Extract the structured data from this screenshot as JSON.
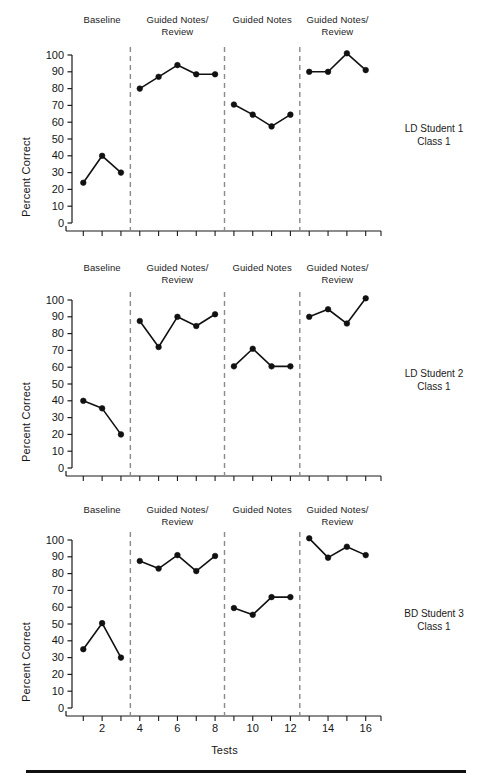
{
  "figure": {
    "xlabel": "Tests",
    "ylabel": "Percent Correct",
    "y_ticks": [
      "0",
      "10",
      "20",
      "30",
      "40",
      "50",
      "60",
      "70",
      "80",
      "90",
      "100"
    ],
    "x_ticks": [
      "2",
      "4",
      "6",
      "8",
      "10",
      "12",
      "14",
      "16"
    ],
    "phase_labels": [
      "Baseline",
      "Guided Notes/\nReview",
      "Guided Notes",
      "Guided Notes/\nReview"
    ],
    "line_color": "#111111",
    "marker_color": "#111111",
    "axis_color": "#1a1a1a",
    "phase_line_color": "#8a8a8a",
    "rule_color": "#111111"
  },
  "chart_data": {
    "type": "line",
    "title": "",
    "xlabel": "Tests",
    "ylabel": "Percent Correct",
    "xlim": [
      0.4,
      16.6
    ],
    "ylim": [
      0,
      100
    ],
    "x_ticks": [
      2,
      4,
      6,
      8,
      10,
      12,
      14,
      16
    ],
    "y_ticks": [
      0,
      10,
      20,
      30,
      40,
      50,
      60,
      70,
      80,
      90,
      100
    ],
    "grid": false,
    "legend": "none",
    "phase_boundaries": [
      3.5,
      8.5,
      12.5
    ],
    "phases": [
      {
        "label": "Baseline",
        "x_range": [
          1,
          3
        ]
      },
      {
        "label": "Guided Notes/\nReview",
        "x_range": [
          4,
          8
        ]
      },
      {
        "label": "Guided Notes",
        "x_range": [
          9,
          12
        ]
      },
      {
        "label": "Guided Notes/\nReview",
        "x_range": [
          13,
          16
        ]
      }
    ],
    "panels": [
      {
        "name": "LD Student 1\nClass 1",
        "series": [
          {
            "name": "Baseline",
            "x": [
              1,
              2,
              3
            ],
            "y": [
              24,
              40,
              30
            ]
          },
          {
            "name": "Guided Notes/Review",
            "x": [
              4,
              5,
              6,
              7,
              8
            ],
            "y": [
              80,
              87,
              94,
              88.5,
              88.5
            ]
          },
          {
            "name": "Guided Notes",
            "x": [
              9,
              10,
              11,
              12
            ],
            "y": [
              70.5,
              64.5,
              57.5,
              64.5
            ]
          },
          {
            "name": "Guided Notes/Review",
            "x": [
              13,
              14,
              15,
              16
            ],
            "y": [
              90,
              90,
              101,
              91
            ]
          }
        ]
      },
      {
        "name": "LD Student 2\nClass 1",
        "series": [
          {
            "name": "Baseline",
            "x": [
              1,
              2,
              3
            ],
            "y": [
              40,
              35.5,
              20
            ]
          },
          {
            "name": "Guided Notes/Review",
            "x": [
              4,
              5,
              6,
              7,
              8
            ],
            "y": [
              87.5,
              72,
              90,
              84.5,
              91.5
            ]
          },
          {
            "name": "Guided Notes",
            "x": [
              9,
              10,
              11,
              12
            ],
            "y": [
              60.5,
              71,
              60.5,
              60.5
            ]
          },
          {
            "name": "Guided Notes/Review",
            "x": [
              13,
              14,
              15,
              16
            ],
            "y": [
              90,
              94.5,
              86,
              101
            ]
          }
        ]
      },
      {
        "name": "BD Student 3\nClass 1",
        "series": [
          {
            "name": "Baseline",
            "x": [
              1,
              2,
              3
            ],
            "y": [
              35,
              50.5,
              30
            ]
          },
          {
            "name": "Guided Notes/Review",
            "x": [
              4,
              5,
              6,
              7,
              8
            ],
            "y": [
              87.5,
              83,
              91,
              81.5,
              90.5
            ]
          },
          {
            "name": "Guided Notes",
            "x": [
              9,
              10,
              11,
              12
            ],
            "y": [
              59.5,
              55.5,
              66,
              66
            ]
          },
          {
            "name": "Guided Notes/Review",
            "x": [
              13,
              14,
              15,
              16
            ],
            "y": [
              101,
              89.5,
              96,
              91
            ]
          }
        ]
      }
    ]
  }
}
